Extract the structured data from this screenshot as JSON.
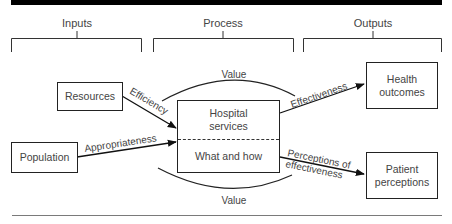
{
  "diagram": {
    "sections": [
      {
        "label": "Inputs"
      },
      {
        "label": "Process"
      },
      {
        "label": "Outputs"
      }
    ],
    "nodes": {
      "resources": "Resources",
      "population": "Population",
      "hospital_services": "Hospital services",
      "what_and_how": "What and how",
      "health_outcomes": "Health outcomes",
      "patient_perceptions": "Patient perceptions"
    },
    "edges": {
      "efficiency": "Efficiency",
      "appropriateness": "Appropriateness",
      "effectiveness": "Effectiveness",
      "perceptions_line1": "Perceptions of",
      "perceptions_line2": "effectiveness",
      "value_top": "Value",
      "value_bottom": "Value"
    },
    "colors": {
      "line": "#222222",
      "text": "#444444",
      "top_bar": "#000000"
    }
  }
}
